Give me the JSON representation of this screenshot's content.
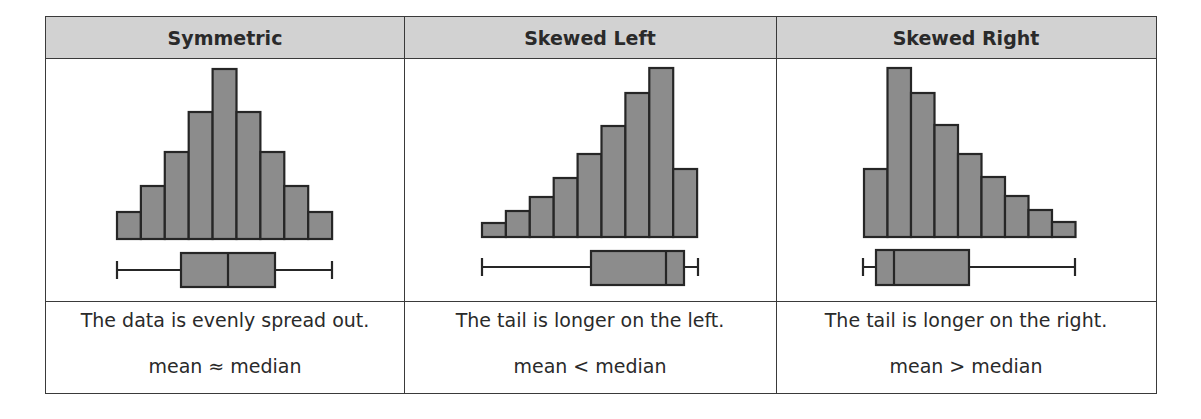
{
  "table": {
    "columns": [
      {
        "header": "Symmetric",
        "description": "The data is evenly spread out.",
        "relation": "mean ≈ median"
      },
      {
        "header": "Skewed Left",
        "description": "The tail is longer on the left.",
        "relation": "mean < median"
      },
      {
        "header": "Skewed Right",
        "description": "The tail is longer on the right.",
        "relation": "mean > median"
      }
    ]
  },
  "colors": {
    "bar_fill": "#8c8c8c",
    "stroke": "#262626",
    "header_bg": "#d2d2d2"
  },
  "chart_data": [
    {
      "type": "bar",
      "title": "Symmetric",
      "categories": [
        "1",
        "2",
        "3",
        "4",
        "5",
        "6",
        "7",
        "8",
        "9"
      ],
      "values": [
        27,
        53,
        87,
        127,
        170,
        127,
        87,
        53,
        27
      ],
      "boxplot": {
        "min": 117,
        "q1": 181,
        "median": 228,
        "q3": 275,
        "max": 332
      },
      "note": "values are relative bar heights (px); boxplot in px positions"
    },
    {
      "type": "bar",
      "title": "Skewed Left",
      "categories": [
        "1",
        "2",
        "3",
        "4",
        "5",
        "6",
        "7",
        "8",
        "9"
      ],
      "values": [
        14,
        26,
        40,
        59,
        83,
        111,
        144,
        169,
        68
      ],
      "boxplot": {
        "min": 482,
        "q1": 591,
        "median": 666,
        "q3": 684,
        "max": 698
      }
    },
    {
      "type": "bar",
      "title": "Skewed Right",
      "categories": [
        "1",
        "2",
        "3",
        "4",
        "5",
        "6",
        "7",
        "8",
        "9"
      ],
      "values": [
        68,
        169,
        144,
        112,
        83,
        60,
        41,
        27,
        15
      ],
      "boxplot": {
        "min": 863,
        "q1": 876,
        "median": 894,
        "q3": 969,
        "max": 1075
      }
    }
  ]
}
